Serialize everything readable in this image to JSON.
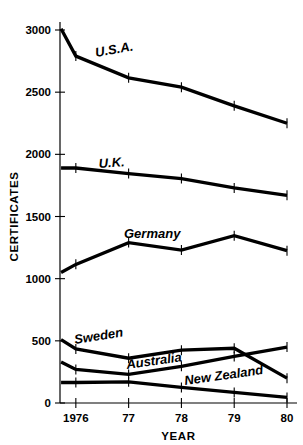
{
  "chart_data": {
    "type": "line",
    "title": "",
    "xlabel": "YEAR",
    "ylabel": "CERTIFICATES",
    "x": [
      1976,
      1977,
      1978,
      1979,
      1980
    ],
    "categories": [
      "1976",
      "77",
      "78",
      "79",
      "80"
    ],
    "xlim": [
      1975.7,
      1980
    ],
    "ylim": [
      0,
      3100
    ],
    "yticks": [
      0,
      500,
      1000,
      1500,
      2000,
      2500,
      3000
    ],
    "ytick_labels": [
      "0",
      "500",
      "1000",
      "1500",
      "2000",
      "2500",
      "3000"
    ],
    "grid": false,
    "legend": "inline-labels",
    "series": [
      {
        "name": "U.S.A.",
        "label": "U.S.A.",
        "x": [
          1975.72,
          1976,
          1977,
          1978,
          1979,
          1980
        ],
        "values": [
          3010,
          2790,
          2615,
          2540,
          2390,
          2250
        ]
      },
      {
        "name": "U.K.",
        "label": "U.K.",
        "x": [
          1975.72,
          1976,
          1977,
          1978,
          1979,
          1980
        ],
        "values": [
          1890,
          1890,
          1845,
          1805,
          1730,
          1670
        ]
      },
      {
        "name": "Germany",
        "label": "Germany",
        "x": [
          1975.72,
          1976,
          1977,
          1978,
          1979,
          1980
        ],
        "values": [
          1050,
          1115,
          1290,
          1230,
          1345,
          1225
        ]
      },
      {
        "name": "Sweden",
        "label": "Sweden",
        "x": [
          1975.72,
          1976,
          1977,
          1978,
          1979,
          1980
        ],
        "values": [
          510,
          435,
          360,
          425,
          440,
          200
        ]
      },
      {
        "name": "Australia",
        "label": "Australia",
        "x": [
          1975.72,
          1976,
          1977,
          1978,
          1979,
          1980
        ],
        "values": [
          330,
          270,
          230,
          295,
          375,
          450
        ]
      },
      {
        "name": "New Zealand",
        "label": "New Zealand",
        "x": [
          1975.72,
          1976,
          1977,
          1978,
          1979,
          1980
        ],
        "values": [
          165,
          165,
          170,
          125,
          85,
          45
        ]
      }
    ],
    "series_label_positions": [
      {
        "name": "U.S.A.",
        "x": 96,
        "y": 57,
        "rotate": -10
      },
      {
        "name": "U.K.",
        "x": 99,
        "y": 168,
        "rotate": -4
      },
      {
        "name": "Germany",
        "x": 124,
        "y": 238,
        "rotate": 0
      },
      {
        "name": "Sweden",
        "x": 75,
        "y": 344,
        "rotate": -9
      },
      {
        "name": "Australia",
        "x": 127,
        "y": 369,
        "rotate": -8
      },
      {
        "name": "New Zealand",
        "x": 185,
        "y": 385,
        "rotate": -8
      }
    ],
    "colors": {
      "line": "#000000",
      "axis": "#000000",
      "background": "#ffffff"
    }
  }
}
